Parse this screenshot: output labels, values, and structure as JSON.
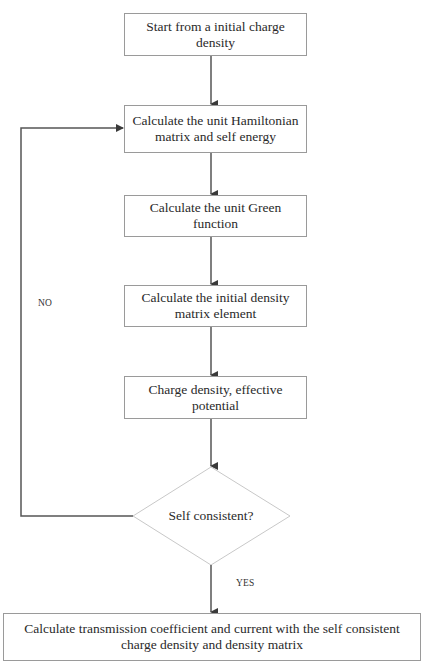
{
  "flowchart": {
    "steps": [
      {
        "id": "start",
        "label": "Start from a initial charge density"
      },
      {
        "id": "hamiltonian",
        "label": "Calculate the unit Hamiltonian matrix and self energy"
      },
      {
        "id": "green",
        "label": "Calculate the unit Green function"
      },
      {
        "id": "density_matrix",
        "label": "Calculate the initial density matrix element"
      },
      {
        "id": "charge_potential",
        "label": "Charge density, effective potential"
      }
    ],
    "decision": {
      "id": "self_consistent",
      "label": "Self consistent?"
    },
    "final": {
      "id": "transmission",
      "label": "Calculate transmission coefficient and current with the self consistent charge density and density matrix"
    },
    "edge_labels": {
      "no": "NO",
      "yes": "YES"
    },
    "colors": {
      "arrow": "#4a4a4a",
      "box_border": "#9a9a9a",
      "diamond_border": "#c8c8c8",
      "text": "#2a2a2a"
    }
  }
}
